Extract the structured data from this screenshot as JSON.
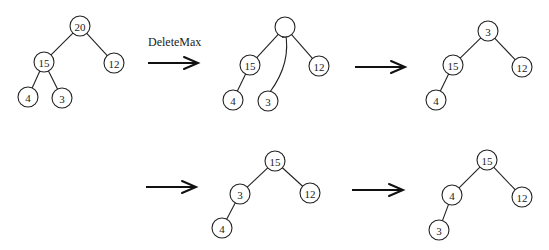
{
  "diagram": {
    "node_radius": 10,
    "trees": [
      {
        "id": "tree-1",
        "nodes": [
          {
            "id": "a",
            "label": "20",
            "x": 80,
            "y": 26
          },
          {
            "id": "b",
            "label": "15",
            "x": 44,
            "y": 62
          },
          {
            "id": "c",
            "label": "12",
            "x": 114,
            "y": 63
          },
          {
            "id": "d",
            "label": "4",
            "x": 28,
            "y": 97
          },
          {
            "id": "e",
            "label": "3",
            "x": 62,
            "y": 98
          }
        ],
        "edges": [
          [
            "a",
            "b"
          ],
          [
            "a",
            "c"
          ],
          [
            "b",
            "d"
          ],
          [
            "b",
            "e"
          ]
        ]
      },
      {
        "id": "tree-2",
        "nodes": [
          {
            "id": "a",
            "label": "",
            "x": 285,
            "y": 27
          },
          {
            "id": "b",
            "label": "15",
            "x": 250,
            "y": 65
          },
          {
            "id": "c",
            "label": "12",
            "x": 319,
            "y": 66
          },
          {
            "id": "d",
            "label": "4",
            "x": 233,
            "y": 100
          },
          {
            "id": "e",
            "label": "3",
            "x": 268,
            "y": 101
          }
        ],
        "edges": [
          [
            "a",
            "b"
          ],
          [
            "a",
            "c"
          ],
          [
            "b",
            "d"
          ]
        ]
      },
      {
        "id": "tree-3",
        "nodes": [
          {
            "id": "a",
            "label": "3",
            "x": 488,
            "y": 31
          },
          {
            "id": "b",
            "label": "15",
            "x": 453,
            "y": 65
          },
          {
            "id": "c",
            "label": "12",
            "x": 522,
            "y": 67
          },
          {
            "id": "d",
            "label": "4",
            "x": 436,
            "y": 100
          }
        ],
        "edges": [
          [
            "a",
            "b"
          ],
          [
            "a",
            "c"
          ],
          [
            "b",
            "d"
          ]
        ]
      },
      {
        "id": "tree-4",
        "nodes": [
          {
            "id": "a",
            "label": "15",
            "x": 275,
            "y": 161
          },
          {
            "id": "b",
            "label": "3",
            "x": 240,
            "y": 194
          },
          {
            "id": "c",
            "label": "12",
            "x": 310,
            "y": 193
          },
          {
            "id": "d",
            "label": "4",
            "x": 222,
            "y": 228
          }
        ],
        "edges": [
          [
            "a",
            "b"
          ],
          [
            "a",
            "c"
          ],
          [
            "b",
            "d"
          ]
        ]
      },
      {
        "id": "tree-5",
        "nodes": [
          {
            "id": "a",
            "label": "15",
            "x": 487,
            "y": 160
          },
          {
            "id": "b",
            "label": "4",
            "x": 452,
            "y": 195
          },
          {
            "id": "c",
            "label": "12",
            "x": 522,
            "y": 197
          },
          {
            "id": "d",
            "label": "3",
            "x": 439,
            "y": 230
          }
        ],
        "edges": [
          [
            "a",
            "b"
          ],
          [
            "a",
            "c"
          ],
          [
            "b",
            "d"
          ]
        ]
      }
    ],
    "arrows": [
      {
        "id": "arrow-1",
        "x1": 148,
        "x2": 198,
        "y": 63,
        "label": "DeleteMax",
        "label_x": 148,
        "label_y": 46
      },
      {
        "id": "arrow-2",
        "x1": 355,
        "x2": 405,
        "y": 67,
        "label": ""
      },
      {
        "id": "arrow-3",
        "x1": 146,
        "x2": 196,
        "y": 187,
        "label": ""
      },
      {
        "id": "arrow-4",
        "x1": 352,
        "x2": 403,
        "y": 190,
        "label": ""
      }
    ],
    "move_arrow": {
      "id": "move-3-to-root",
      "from": {
        "x": 270,
        "y": 92
      },
      "control": {
        "x": 292,
        "y": 62
      },
      "to": {
        "x": 285,
        "y": 31
      }
    }
  }
}
